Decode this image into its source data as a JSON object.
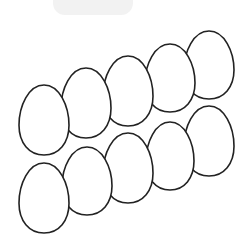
{
  "counter": {
    "number": "10",
    "badge_color": "#f2f2f2",
    "text_color": "#111111"
  },
  "illustration": {
    "subject": "eggs",
    "count": 10,
    "outline_color": "#222222",
    "fill_color": "#ffffff",
    "rows": [
      {
        "name": "top-row",
        "eggs": [
          {
            "cx": 44,
            "cy": 120,
            "rx": 25,
            "ry": 35
          },
          {
            "cx": 86,
            "cy": 103,
            "rx": 25,
            "ry": 35
          },
          {
            "cx": 128,
            "cy": 91,
            "rx": 25,
            "ry": 35
          },
          {
            "cx": 170,
            "cy": 78,
            "rx": 25,
            "ry": 34
          },
          {
            "cx": 209,
            "cy": 65,
            "rx": 25,
            "ry": 34
          }
        ]
      },
      {
        "name": "bottom-row",
        "eggs": [
          {
            "cx": 44,
            "cy": 198,
            "rx": 25,
            "ry": 35
          },
          {
            "cx": 87,
            "cy": 181,
            "rx": 25,
            "ry": 34
          },
          {
            "cx": 128,
            "cy": 168,
            "rx": 25,
            "ry": 35
          },
          {
            "cx": 170,
            "cy": 156,
            "rx": 24,
            "ry": 34
          },
          {
            "cx": 209,
            "cy": 141,
            "rx": 25,
            "ry": 35
          }
        ]
      }
    ]
  }
}
